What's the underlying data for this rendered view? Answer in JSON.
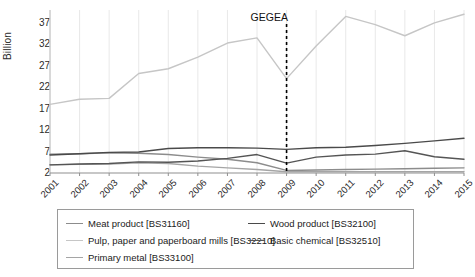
{
  "chart_data": {
    "type": "line",
    "title": "",
    "xlabel": "",
    "ylabel": "Billion",
    "categories": [
      "2001",
      "2002",
      "2003",
      "2004",
      "2005",
      "2006",
      "2007",
      "2008",
      "2009",
      "2010",
      "2011",
      "2012",
      "2013",
      "2014",
      "2015"
    ],
    "x": [
      2001,
      2002,
      2003,
      2004,
      2005,
      2006,
      2007,
      2008,
      2009,
      2010,
      2011,
      2012,
      2013,
      2014,
      2015
    ],
    "ylim": [
      2,
      40
    ],
    "yticks": [
      2,
      7,
      12,
      17,
      22,
      27,
      32,
      37
    ],
    "grid": "vertical",
    "legend_position": "bottom",
    "annotations": [
      {
        "text": "GEGEA",
        "x": 2009,
        "style": "dashed-vertical-line",
        "color": "#000000"
      }
    ],
    "series": [
      {
        "name": "Meat product [BS31160]",
        "code": "BS31160",
        "color": "#8c8c8c",
        "values": [
          6.4,
          6.5,
          6.7,
          6.6,
          6.3,
          5.7,
          5.2,
          4.4,
          2.6,
          2.7,
          2.8,
          2.9,
          3.0,
          3.1,
          3.2
        ]
      },
      {
        "name": "Pulp, paper and paperboard mills [BS32210]",
        "code": "BS32210",
        "color": "#c6c6c6",
        "values": [
          18.0,
          19.2,
          19.4,
          25.2,
          26.3,
          29.0,
          32.3,
          33.5,
          24.0,
          31.6,
          38.5,
          36.6,
          34.0,
          37.0,
          39.0
        ]
      },
      {
        "name": "Primary metal [BS33100]",
        "code": "BS33100",
        "color": "#a5a5a5",
        "values": [
          3.9,
          4.0,
          4.1,
          4.4,
          4.2,
          3.6,
          3.2,
          2.8,
          2.3,
          2.3,
          2.3,
          2.3,
          2.3,
          2.3,
          2.3
        ]
      },
      {
        "name": "Wood product [BS32100]",
        "code": "BS32100",
        "color": "#4a4a4a",
        "values": [
          6.2,
          6.5,
          6.8,
          6.9,
          7.7,
          7.9,
          7.9,
          7.8,
          7.5,
          7.9,
          8.0,
          8.4,
          8.9,
          9.5,
          10.1
        ]
      },
      {
        "name": "Basic chemical [BS32510]",
        "code": "BS32510",
        "color": "#555555",
        "values": [
          3.9,
          4.1,
          4.2,
          4.6,
          4.5,
          4.8,
          5.4,
          6.3,
          4.3,
          5.7,
          6.2,
          6.4,
          7.2,
          5.8,
          5.2
        ]
      }
    ]
  },
  "legend": {
    "columns": [
      {
        "items": [
          {
            "label": "Meat product [BS31160]",
            "series": 0
          },
          {
            "label": "Pulp, paper and paperboard mills [BS32210]",
            "series": 1
          },
          {
            "label": "Primary metal [BS33100]",
            "series": 2
          }
        ]
      },
      {
        "items": [
          {
            "label": "Wood product [BS32100]",
            "series": 3
          },
          {
            "label": "Basic chemical [BS32510]",
            "series": 4
          }
        ]
      }
    ]
  }
}
